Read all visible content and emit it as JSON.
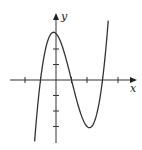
{
  "chart_data": {
    "type": "line",
    "title": "",
    "function": "y = (x+1)(x-1)(x-3)",
    "xlabel": "x",
    "ylabel": "y",
    "x_ticks": [
      -2,
      -1,
      1,
      2,
      3,
      4
    ],
    "y_ticks": [
      -3,
      -2,
      -1,
      1,
      2
    ],
    "xlim": [
      -3,
      5.2
    ],
    "ylim": [
      -4.1,
      4.3
    ],
    "grid": false,
    "x_intercepts": [
      -1,
      1,
      3
    ],
    "y_intercept": 3,
    "local_max": {
      "x": -0.15,
      "y": 3.08
    },
    "local_min": {
      "x": 2.15,
      "y": -3.08
    },
    "series": [
      {
        "name": "curve",
        "x_range": [
          -1.38,
          3.37
        ]
      }
    ]
  },
  "labels": {
    "x_axis": "x",
    "y_axis": "y"
  },
  "colors": {
    "curve": "#333333",
    "axes": "#333333"
  }
}
